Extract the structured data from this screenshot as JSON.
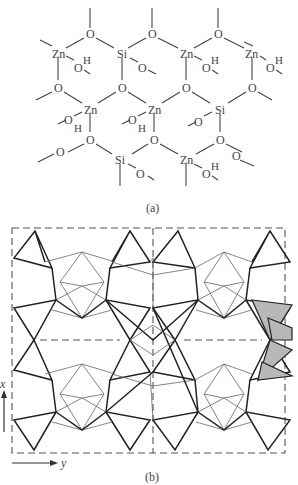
{
  "figure": {
    "panel_a": {
      "caption": "(a)",
      "atoms": {
        "zinc": "Zn",
        "silicon": "Si",
        "oxygen": "O",
        "hydrogen": "H"
      },
      "description": "Hexagonal network of Zn and Si tetrahedral centers bridged by O, with terminal OH groups on Zn"
    },
    "panel_b": {
      "caption": "(b)",
      "axis_x_label": "x",
      "axis_y_label": "y",
      "description": "Polyhedral projection of the framework with dashed unit-cell outline; one polyhedron chain shaded gray at right",
      "colors": {
        "shade": "#b8b8b8",
        "line": "#222222"
      }
    }
  }
}
